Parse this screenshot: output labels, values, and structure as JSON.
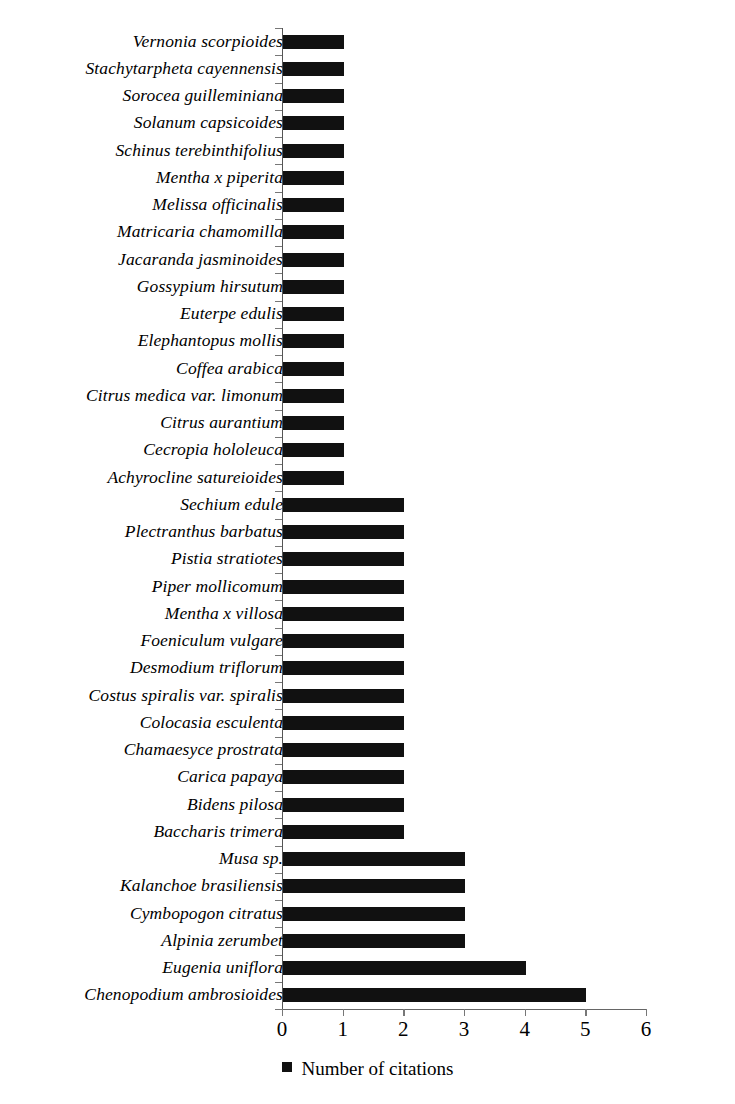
{
  "chart_data": {
    "type": "bar",
    "orientation": "horizontal",
    "title": "",
    "subtitle": "",
    "xlabel": "",
    "ylabel": "",
    "xlim": [
      0,
      6
    ],
    "xticks": [
      0,
      1,
      2,
      3,
      4,
      5,
      6
    ],
    "xtick_labels": [
      "0",
      "1",
      "2",
      "3",
      "4",
      "5",
      "6"
    ],
    "grid": false,
    "legend_position": "bottom-center",
    "legend": [
      {
        "name": "Number of citations",
        "color": "#111111",
        "marker": "square"
      }
    ],
    "series": [
      {
        "name": "Number of citations",
        "color": "#111111",
        "values": [
          1,
          1,
          1,
          1,
          1,
          1,
          1,
          1,
          1,
          1,
          1,
          1,
          1,
          1,
          1,
          1,
          1,
          2,
          2,
          2,
          2,
          2,
          2,
          2,
          2,
          2,
          2,
          2,
          2,
          2,
          3,
          3,
          3,
          3,
          4,
          5
        ]
      }
    ],
    "categories": [
      "Vernonia scorpioides",
      "Stachytarpheta cayennensis",
      "Sorocea guilleminiana",
      "Solanum capsicoides",
      "Schinus terebinthifolius",
      "Mentha x piperita",
      "Melissa officinalis",
      "Matricaria chamomilla",
      "Jacaranda jasminoides",
      "Gossypium hirsutum",
      "Euterpe edulis",
      "Elephantopus mollis",
      "Coffea arabica",
      "Citrus medica var. limonum",
      "Citrus aurantium",
      "Cecropia hololeuca",
      "Achyrocline satureioides",
      "Sechium edule",
      "Plectranthus barbatus",
      "Pistia stratiotes",
      "Piper mollicomum",
      "Mentha x villosa",
      "Foeniculum vulgare",
      "Desmodium triflorum",
      "Costus spiralis var. spiralis",
      "Colocasia esculenta",
      "Chamaesyce prostrata",
      "Carica papaya",
      "Bidens pilosa",
      "Baccharis trimera",
      "Musa sp.",
      "Kalanchoe brasiliensis",
      "Cymbopogon citratus",
      "Alpinia zerumbet",
      "Eugenia uniflora",
      "Chenopodium ambrosioides"
    ]
  },
  "legend": {
    "label": "Number of citations"
  },
  "colors": {
    "bar": "#111111",
    "axis": "#666666",
    "tick": "#777777",
    "background": "#ffffff"
  }
}
